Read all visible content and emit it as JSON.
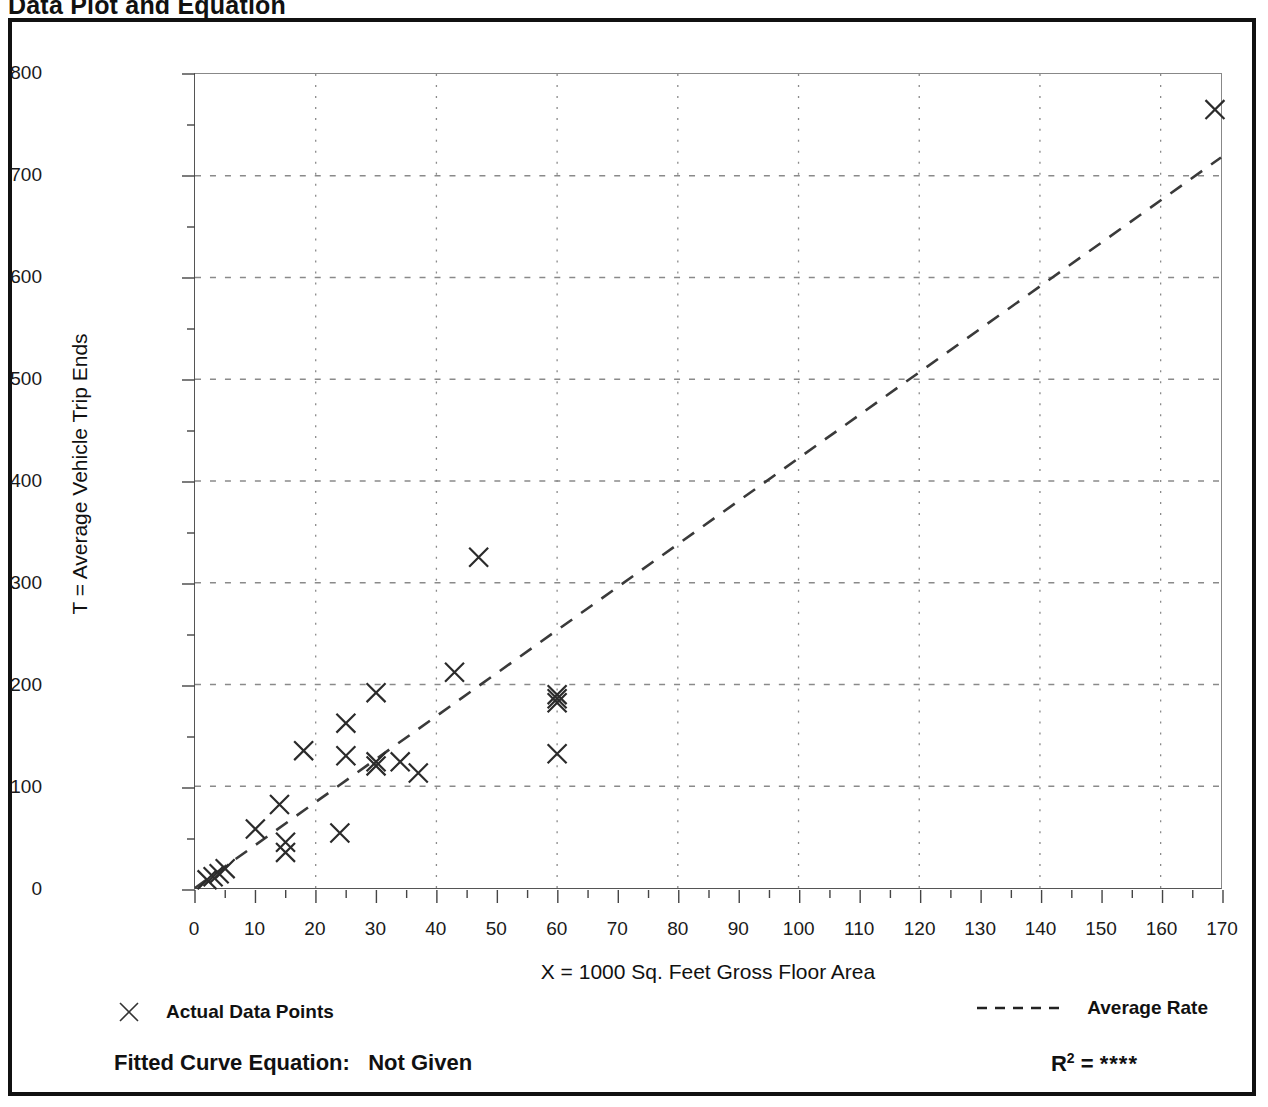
{
  "page": {
    "title": "Data Plot and Equation"
  },
  "legend": {
    "points_marker": "x-marker-icon",
    "points_label": "Actual Data Points",
    "line_marker": "dashed-line-icon",
    "line_label": "Average Rate"
  },
  "footer": {
    "equation_label": "Fitted Curve Equation:",
    "equation_value": "Not Given",
    "r2_symbol": "R",
    "r2_exponent": "2",
    "r2_equals": "=",
    "r2_value": "****"
  },
  "chart_data": {
    "type": "scatter",
    "title": "Data Plot and Equation",
    "xlabel": "X = 1000 Sq. Feet Gross Floor Area",
    "ylabel": "T = Average Vehicle Trip Ends",
    "xlim": [
      0,
      170
    ],
    "ylim": [
      0,
      800
    ],
    "xticks": [
      0,
      10,
      20,
      30,
      40,
      50,
      60,
      70,
      80,
      90,
      100,
      110,
      120,
      130,
      140,
      150,
      160,
      170
    ],
    "yticks": [
      0,
      100,
      200,
      300,
      400,
      500,
      600,
      700,
      800
    ],
    "x_minor_tick_step": 5,
    "y_minor_tick_step": 50,
    "grid": true,
    "grid_style": "dotted",
    "grid_x_values": [
      20,
      40,
      60,
      80,
      100,
      120,
      140,
      160
    ],
    "grid_y_values": [
      100,
      200,
      300,
      400,
      500,
      600,
      700
    ],
    "legend_position": "below-plot",
    "series": [
      {
        "name": "Actual Data Points",
        "type": "scatter",
        "marker": "x",
        "points": [
          {
            "x": 2,
            "y": 8
          },
          {
            "x": 3,
            "y": 11
          },
          {
            "x": 4,
            "y": 14
          },
          {
            "x": 5,
            "y": 19
          },
          {
            "x": 10,
            "y": 58
          },
          {
            "x": 14,
            "y": 82
          },
          {
            "x": 15,
            "y": 45
          },
          {
            "x": 15,
            "y": 35
          },
          {
            "x": 18,
            "y": 135
          },
          {
            "x": 24,
            "y": 54
          },
          {
            "x": 25,
            "y": 130
          },
          {
            "x": 25,
            "y": 162
          },
          {
            "x": 30,
            "y": 192
          },
          {
            "x": 30,
            "y": 124
          },
          {
            "x": 30,
            "y": 120
          },
          {
            "x": 34,
            "y": 124
          },
          {
            "x": 37,
            "y": 113
          },
          {
            "x": 43,
            "y": 212
          },
          {
            "x": 47,
            "y": 325
          },
          {
            "x": 60,
            "y": 190
          },
          {
            "x": 60,
            "y": 186
          },
          {
            "x": 60,
            "y": 182
          },
          {
            "x": 60,
            "y": 132
          },
          {
            "x": 169,
            "y": 765
          }
        ]
      },
      {
        "name": "Average Rate",
        "type": "line",
        "style": "dashed",
        "x": [
          0,
          170
        ],
        "y": [
          0,
          718
        ]
      }
    ]
  }
}
